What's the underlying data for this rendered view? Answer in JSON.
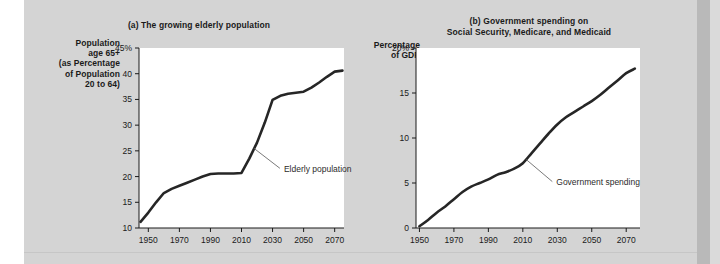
{
  "figure": {
    "background_color": "#d4d4d4",
    "plot_background_color": "#ffffff",
    "line_color": "#262626",
    "text_color": "#1a1a1a"
  },
  "panels": [
    {
      "id": "a",
      "title": "(a) The growing elderly population",
      "title_lines": [
        "(a) The growing elderly population"
      ],
      "y_axis_label_lines": [
        "Population",
        "age 65+",
        "(as Percentage",
        "of Population",
        "20 to 64)"
      ],
      "y_axis_label": "Population age 65+ (as Percentage of Population 20 to 64)",
      "y_ticks": [
        "45%",
        "40",
        "35",
        "30",
        "25",
        "20",
        "15",
        "10"
      ],
      "x_ticks": [
        "1950",
        "1970",
        "1990",
        "2010",
        "2030",
        "2050",
        "2070"
      ],
      "annotation": "Elderly population"
    },
    {
      "id": "b",
      "title": "(b) Government spending on Social Security, Medicare, and Medicaid",
      "title_lines": [
        "(b) Government spending on",
        "Social Security, Medicare, and Medicaid"
      ],
      "y_axis_label_lines": [
        "Percentage",
        "of GDP"
      ],
      "y_axis_label": "Percentage of GDP",
      "y_ticks": [
        "20%",
        "15",
        "10",
        "5",
        "0"
      ],
      "x_ticks": [
        "1950",
        "1970",
        "1990",
        "2010",
        "2030",
        "2050",
        "2070"
      ],
      "annotation": "Government spending"
    }
  ],
  "chart_data": [
    {
      "type": "line",
      "panel": "a",
      "title": "(a) The growing elderly population",
      "xlabel": "",
      "ylabel": "Population age 65+ (as Percentage of Population 20 to 64)",
      "xlim": [
        1944,
        2076
      ],
      "ylim": [
        10,
        45
      ],
      "xticks": [
        1950,
        1970,
        1990,
        2010,
        2030,
        2050,
        2070
      ],
      "yticks": [
        10,
        15,
        20,
        25,
        30,
        35,
        40,
        45
      ],
      "grid": false,
      "legend": "none",
      "series": [
        {
          "name": "Elderly population",
          "x": [
            1945,
            1950,
            1955,
            1960,
            1965,
            1970,
            1975,
            1980,
            1985,
            1990,
            1995,
            2000,
            2005,
            2010,
            2015,
            2020,
            2025,
            2030,
            2035,
            2040,
            2045,
            2050,
            2055,
            2060,
            2065,
            2070,
            2075
          ],
          "y": [
            11.2,
            13.0,
            15.0,
            16.8,
            17.6,
            18.2,
            18.8,
            19.4,
            20.0,
            20.5,
            20.6,
            20.6,
            20.6,
            20.7,
            23.5,
            26.6,
            30.5,
            34.9,
            35.7,
            36.1,
            36.3,
            36.5,
            37.3,
            38.3,
            39.4,
            40.4,
            40.6
          ]
        }
      ],
      "annotations": [
        {
          "text": "Elderly population",
          "points_to_x": 2018,
          "points_to_y": 25.5
        }
      ]
    },
    {
      "type": "line",
      "panel": "b",
      "title": "(b) Government spending on Social Security, Medicare, and Medicaid",
      "xlabel": "",
      "ylabel": "Percentage of GDP",
      "xlim": [
        1948,
        2078
      ],
      "ylim": [
        0,
        20
      ],
      "xticks": [
        1950,
        1970,
        1990,
        2010,
        2030,
        2050,
        2070
      ],
      "yticks": [
        0,
        5,
        10,
        15,
        20
      ],
      "grid": false,
      "legend": "none",
      "series": [
        {
          "name": "Government spending",
          "x": [
            1950,
            1955,
            1960,
            1965,
            1970,
            1975,
            1980,
            1985,
            1990,
            1995,
            2000,
            2005,
            2010,
            2015,
            2020,
            2025,
            2030,
            2035,
            2040,
            2045,
            2050,
            2055,
            2060,
            2065,
            2070,
            2075
          ],
          "y": [
            0.2,
            0.9,
            1.7,
            2.4,
            3.2,
            4.0,
            4.6,
            5.0,
            5.4,
            5.9,
            6.2,
            6.6,
            7.2,
            8.3,
            9.4,
            10.5,
            11.5,
            12.3,
            12.9,
            13.5,
            14.1,
            14.8,
            15.6,
            16.4,
            17.2,
            17.7
          ]
        }
      ],
      "annotations": [
        {
          "text": "Government spending",
          "points_to_x": 2012,
          "points_to_y": 7.6
        }
      ]
    }
  ]
}
